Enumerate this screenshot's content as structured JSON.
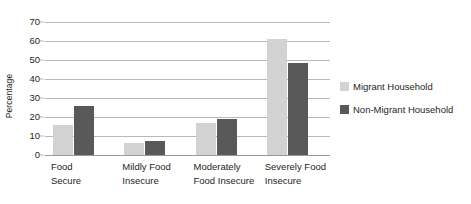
{
  "chart_data": {
    "type": "bar",
    "title": "",
    "subtitle": "",
    "xlabel": "",
    "ylabel": "Percentage",
    "ylim": [
      0,
      70
    ],
    "ytick_labels": [
      "70",
      "60",
      "50",
      "40",
      "30",
      "20",
      "10",
      "0"
    ],
    "ytick_values": [
      70,
      60,
      50,
      40,
      30,
      20,
      10,
      0
    ],
    "grid": true,
    "legend_position": "right",
    "categories": [
      "Food\nSecure",
      "Mildly Food\nInsecure",
      "Moderately\nFood Insecure",
      "Severely Food\nInsecure"
    ],
    "series": [
      {
        "name": "Migrant Household",
        "color": "#d2d2d2",
        "values": [
          16,
          6.5,
          17,
          61
        ]
      },
      {
        "name": "Non-Migrant Household",
        "color": "#595959",
        "values": [
          26,
          7.5,
          19,
          48.5
        ]
      }
    ]
  },
  "colors": {
    "migrant": "#d2d2d2",
    "non_migrant": "#595959",
    "gridline": "#b8b8b8",
    "axis": "#9a9a9a",
    "text": "#231f20",
    "background": "#ffffff"
  }
}
